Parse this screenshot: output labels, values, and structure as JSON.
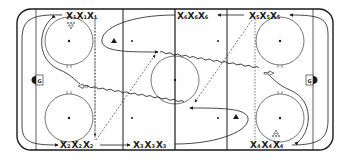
{
  "diagram": {
    "type": "hockey-drill",
    "colors": {
      "line": "#1a1a1a",
      "background": "#ffffff"
    },
    "rink": {
      "x": 17,
      "y": 9,
      "width": 316,
      "height": 141,
      "corner_radius": 14
    },
    "lines": {
      "goal_lines_x": [
        36,
        313
      ],
      "blue_lines_x": [
        123,
        227
      ],
      "center_line_x": 175,
      "dashed_lines_x": [
        95,
        255
      ]
    },
    "goals": [
      {
        "label": "G",
        "x": 36,
        "y": 80,
        "side": "left"
      },
      {
        "label": "G",
        "x": 313,
        "y": 80,
        "side": "right"
      }
    ],
    "player_groups": [
      {
        "letter": "X",
        "number": "1",
        "x": 66,
        "y": 19
      },
      {
        "letter": "X",
        "number": "2",
        "x": 60,
        "y": 147
      },
      {
        "letter": "X",
        "number": "3",
        "x": 133,
        "y": 147
      },
      {
        "letter": "X",
        "number": "4",
        "x": 250,
        "y": 147
      },
      {
        "letter": "X",
        "number": "5",
        "x": 249,
        "y": 19
      },
      {
        "letter": "X",
        "number": "6",
        "x": 177,
        "y": 19
      }
    ],
    "markers": [
      {
        "type": "cone",
        "x": 114,
        "y": 42
      },
      {
        "type": "cone",
        "x": 236,
        "y": 118
      },
      {
        "type": "pucks",
        "x": 70,
        "y": 25
      },
      {
        "type": "pucks",
        "x": 276,
        "y": 134
      }
    ]
  }
}
